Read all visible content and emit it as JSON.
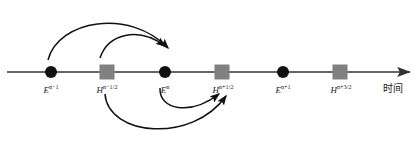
{
  "figure": {
    "title": "",
    "axis": {
      "name": "时间",
      "name_x": 393,
      "name_y": 84,
      "line_y": 72,
      "x_start": 7,
      "x_end": 412,
      "color": "#333333",
      "arrow_head": "right-arrow-head"
    },
    "colors": {
      "e_marker": "#111111",
      "h_marker": "#808080",
      "stroke": "#333333",
      "text": "#1a1a1a"
    },
    "nodes": [
      {
        "id": "e-n-minus-1",
        "kind": "circle",
        "x": 51,
        "base": "E",
        "exponent": "n−1",
        "label": "E",
        "sup": "n−1",
        "label_y": 86
      },
      {
        "id": "h-n-minus-half",
        "kind": "square",
        "x": 107,
        "base": "H",
        "exponent": "n−1/2",
        "label": "H",
        "sup": "n−1/2",
        "label_y": 86
      },
      {
        "id": "e-n",
        "kind": "circle",
        "x": 165,
        "base": "E",
        "exponent": "n",
        "label": "E",
        "sup": "n",
        "label_y": 86
      },
      {
        "id": "h-n-plus-half",
        "kind": "square",
        "x": 222,
        "base": "H",
        "exponent": "n+1/2",
        "label": "H",
        "sup": "n+1/2",
        "label_y": 86
      },
      {
        "id": "e-n-plus-1",
        "kind": "circle",
        "x": 283,
        "base": "E",
        "exponent": "n+1",
        "label": "E",
        "sup": "n+1",
        "label_y": 86
      },
      {
        "id": "h-n-plus-3half",
        "kind": "square",
        "x": 340,
        "base": "H",
        "exponent": "n+3/2",
        "label": "H",
        "sup": "n+3/2",
        "label_y": 86
      }
    ],
    "arrows": [
      {
        "id": "arc-e-nm1-to-top",
        "position": "above",
        "from": "e-n-minus-1",
        "to": "e-n",
        "path": "M 48 60 C 58 20, 130 8, 168 48"
      },
      {
        "id": "arc-h-nmh-to-top",
        "position": "above",
        "from": "h-n-minus-half",
        "to": "e-n",
        "path": "M 100 58 C 108 34, 138 26, 165 46"
      },
      {
        "id": "arc-h-nmh-to-low",
        "position": "below",
        "from": "h-n-minus-half",
        "to": "h-n-plus-half",
        "path": "M 105 94 C 108 132, 190 142, 225 95"
      },
      {
        "id": "arc-e-n-to-low",
        "position": "below",
        "from": "e-n",
        "to": "h-n-plus-half",
        "path": "M 160 88 C 160 110, 190 114, 219 93"
      }
    ],
    "marker_sizes": {
      "circle_radius": 6,
      "square_side": 15
    }
  }
}
